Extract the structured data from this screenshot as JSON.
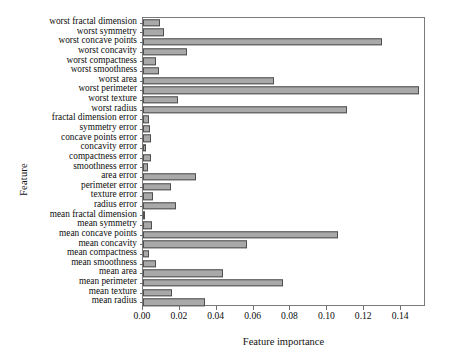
{
  "chart_data": {
    "type": "bar",
    "orientation": "horizontal",
    "title": "",
    "xlabel": "Feature importance",
    "ylabel": "Feature",
    "xlim": [
      0.0,
      0.1535
    ],
    "grid": false,
    "legend": null,
    "xticks": [
      "0.00",
      "0.02",
      "0.04",
      "0.06",
      "0.08",
      "0.10",
      "0.12",
      "0.14"
    ],
    "xtick_values": [
      0.0,
      0.02,
      0.04,
      0.06,
      0.08,
      0.1,
      0.12,
      0.14
    ],
    "bar_color": "#a9a9a9",
    "bar_edge_color": "#4f4f4f",
    "categories": [
      "worst fractal dimension",
      "worst symmetry",
      "worst concave points",
      "worst concavity",
      "worst compactness",
      "worst smoothness",
      "worst area",
      "worst perimeter",
      "worst texture",
      "worst radius",
      "fractal dimension error",
      "symmetry error",
      "concave points error",
      "concavity error",
      "compactness error",
      "smoothness error",
      "area error",
      "perimeter error",
      "texture error",
      "radius error",
      "mean fractal dimension",
      "mean symmetry",
      "mean concave points",
      "mean concavity",
      "mean compactness",
      "mean smoothness",
      "mean area",
      "mean perimeter",
      "mean texture",
      "mean radius"
    ],
    "values": [
      0.0093,
      0.0116,
      0.1295,
      0.0238,
      0.0072,
      0.0086,
      0.0712,
      0.1495,
      0.0192,
      0.1105,
      0.0031,
      0.0039,
      0.0041,
      0.0015,
      0.0042,
      0.0028,
      0.0285,
      0.0153,
      0.0053,
      0.0178,
      0.0013,
      0.0051,
      0.1058,
      0.0565,
      0.0031,
      0.0073,
      0.0432,
      0.0762,
      0.0155,
      0.0337
    ]
  }
}
